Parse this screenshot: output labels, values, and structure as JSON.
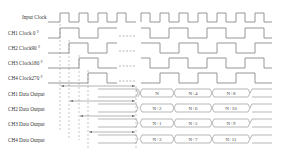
{
  "diagram": {
    "type": "timing-diagram",
    "signals": [
      {
        "id": "input_clock",
        "label": "Input Clock"
      },
      {
        "id": "ch1_clock",
        "label": "CH1  Clock 0 °"
      },
      {
        "id": "ch2_clock",
        "label": "CH2  Clock90 °"
      },
      {
        "id": "ch3_clock",
        "label": "CH3  Clock180 °"
      },
      {
        "id": "ch4_clock",
        "label": "CH4  Clock270 °"
      },
      {
        "id": "ch1_data",
        "label": "CH1  Data Output"
      },
      {
        "id": "ch2_data",
        "label": "CH2  Data Output"
      },
      {
        "id": "ch3_data",
        "label": "CH3  Data Output"
      },
      {
        "id": "ch4_data",
        "label": "CH4  Data Output"
      }
    ],
    "data_words": {
      "ch1": [
        "N",
        "N+4",
        "N+8"
      ],
      "ch2": [
        "N+2",
        "N+6",
        "N+10"
      ],
      "ch3": [
        "N+1",
        "N+5",
        "N+9"
      ],
      "ch4": [
        "N+3",
        "N+7",
        "N+11"
      ]
    },
    "colors": {
      "waveform": "#8a8a8a",
      "text": "#333333",
      "background": "#ffffff"
    }
  }
}
